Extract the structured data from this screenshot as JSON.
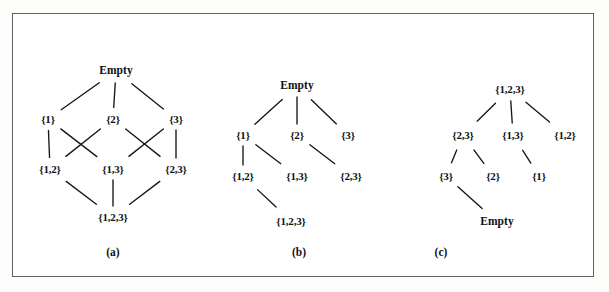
{
  "figure": {
    "background_color": "#ffffff",
    "frame_color": "#5d6066",
    "text_color": "#101114",
    "edge_color": "#15161a"
  },
  "panels": [
    {
      "id": "a",
      "caption": "(a)",
      "caption_pos": {
        "x": 100,
        "y": 238
      },
      "nodes": [
        {
          "id": "empty",
          "label": "Empty",
          "x": 103,
          "y": 57
        },
        {
          "id": "s1",
          "label": "{1}",
          "x": 35,
          "y": 105
        },
        {
          "id": "s2",
          "label": "{2}",
          "x": 100,
          "y": 105
        },
        {
          "id": "s3",
          "label": "{3}",
          "x": 163,
          "y": 105
        },
        {
          "id": "s12",
          "label": "{1,2}",
          "x": 37,
          "y": 155
        },
        {
          "id": "s13",
          "label": "{1,3}",
          "x": 100,
          "y": 155
        },
        {
          "id": "s23",
          "label": "{2,3}",
          "x": 163,
          "y": 155
        },
        {
          "id": "s123",
          "label": "{1,2,3}",
          "x": 100,
          "y": 203
        }
      ],
      "edges": [
        {
          "from": "empty",
          "to": "s1"
        },
        {
          "from": "empty",
          "to": "s2"
        },
        {
          "from": "empty",
          "to": "s3"
        },
        {
          "from": "s1",
          "to": "s12"
        },
        {
          "from": "s1",
          "to": "s13"
        },
        {
          "from": "s2",
          "to": "s12"
        },
        {
          "from": "s2",
          "to": "s23"
        },
        {
          "from": "s3",
          "to": "s13"
        },
        {
          "from": "s3",
          "to": "s23"
        },
        {
          "from": "s12",
          "to": "s123"
        },
        {
          "from": "s13",
          "to": "s123"
        },
        {
          "from": "s23",
          "to": "s123"
        }
      ]
    },
    {
      "id": "b",
      "caption": "(b)",
      "caption_pos": {
        "x": 96,
        "y": 238
      },
      "nodes": [
        {
          "id": "empty",
          "label": "Empty",
          "x": 94,
          "y": 72
        },
        {
          "id": "s1",
          "label": "{1}",
          "x": 40,
          "y": 121
        },
        {
          "id": "s2",
          "label": "{2}",
          "x": 94,
          "y": 121
        },
        {
          "id": "s3",
          "label": "{3}",
          "x": 145,
          "y": 121
        },
        {
          "id": "s12",
          "label": "{1,2}",
          "x": 40,
          "y": 162
        },
        {
          "id": "s13",
          "label": "{1,3}",
          "x": 94,
          "y": 162
        },
        {
          "id": "s23",
          "label": "{2,3}",
          "x": 148,
          "y": 162
        },
        {
          "id": "s123",
          "label": "{1,2,3}",
          "x": 88,
          "y": 207
        }
      ],
      "edges": [
        {
          "from": "empty",
          "to": "s1"
        },
        {
          "from": "empty",
          "to": "s2"
        },
        {
          "from": "empty",
          "to": "s3"
        },
        {
          "from": "s1",
          "to": "s12"
        },
        {
          "from": "s1",
          "to": "s13"
        },
        {
          "from": "s2",
          "to": "s23"
        },
        {
          "from": "s12",
          "to": "s123"
        }
      ]
    },
    {
      "id": "c",
      "caption": "(c)",
      "caption_pos": {
        "x": 33,
        "y": 238
      },
      "nodes": [
        {
          "id": "s123",
          "label": "{1,2,3}",
          "x": 102,
          "y": 75
        },
        {
          "id": "s23",
          "label": "{2,3}",
          "x": 55,
          "y": 121
        },
        {
          "id": "s13",
          "label": "{1,3}",
          "x": 105,
          "y": 121
        },
        {
          "id": "s12",
          "label": "{1,2}",
          "x": 157,
          "y": 121
        },
        {
          "id": "s3",
          "label": "{3}",
          "x": 38,
          "y": 162
        },
        {
          "id": "s2",
          "label": "{2}",
          "x": 85,
          "y": 162
        },
        {
          "id": "s1",
          "label": "{1}",
          "x": 131,
          "y": 162
        },
        {
          "id": "empty",
          "label": "Empty",
          "x": 89,
          "y": 208
        }
      ],
      "edges": [
        {
          "from": "s123",
          "to": "s23"
        },
        {
          "from": "s123",
          "to": "s13"
        },
        {
          "from": "s123",
          "to": "s12"
        },
        {
          "from": "s23",
          "to": "s3"
        },
        {
          "from": "s23",
          "to": "s2"
        },
        {
          "from": "s13",
          "to": "s1"
        },
        {
          "from": "s3",
          "to": "empty"
        }
      ]
    }
  ]
}
